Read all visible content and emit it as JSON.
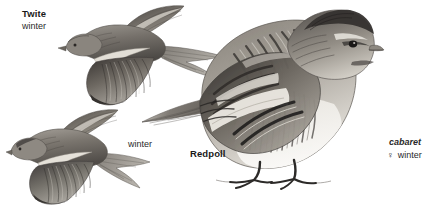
{
  "plate": {
    "background_color": "#ffffff",
    "ink_color": "#1a1a1a",
    "width": 443,
    "height": 206
  },
  "labels": {
    "twite_name": "Twite",
    "twite_season": "winter",
    "redpoll_season": "winter",
    "redpoll_name": "Redpoll",
    "cabaret_race": "cabaret",
    "cabaret_sex_symbol": "♀",
    "cabaret_season": "winter"
  },
  "figures": [
    {
      "name": "twite-flying",
      "species": "Twite",
      "plumage": "winter",
      "pose": "flying, upperside, head to left, forked tail to right"
    },
    {
      "name": "redpoll-flying",
      "species": "Redpoll",
      "plumage": "winter",
      "pose": "flying, upperside, head to left, forked tail to right"
    },
    {
      "name": "redpoll-perched",
      "species": "Redpoll",
      "race": "cabaret",
      "sex": "female",
      "plumage": "winter",
      "pose": "perched, facing right, long tail to left"
    }
  ]
}
